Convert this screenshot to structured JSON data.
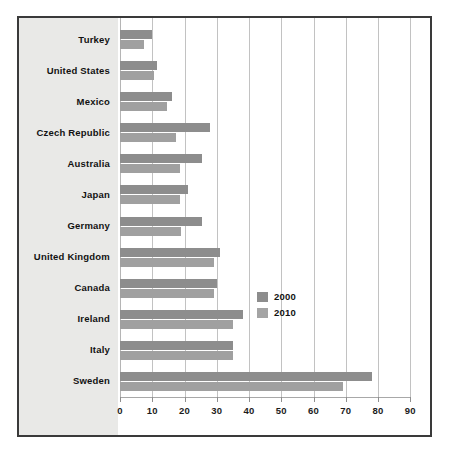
{
  "chart_data": {
    "type": "bar",
    "orientation": "horizontal",
    "title": "",
    "subtitle": "",
    "xlabel": "",
    "ylabel": "",
    "xlim": [
      0,
      90
    ],
    "xticks": [
      0,
      10,
      20,
      30,
      40,
      50,
      60,
      70,
      80,
      90
    ],
    "xtick_labels": [
      "0",
      "10",
      "20",
      "30",
      "40",
      "50",
      "60",
      "70",
      "80",
      "90"
    ],
    "grid": true,
    "grid_axis": "x",
    "legend_position": "middle-right",
    "categories": [
      "Turkey",
      "United States",
      "Mexico",
      "Czech Republic",
      "Australia",
      "Japan",
      "Germany",
      "United Kingdom",
      "Canada",
      "Ireland",
      "Italy",
      "Sweden"
    ],
    "series": [
      {
        "name": "2000",
        "color": "#8d8d8d",
        "values": [
          10,
          11.5,
          16,
          28,
          25.5,
          21,
          25.5,
          31,
          30,
          38,
          35,
          78
        ]
      },
      {
        "name": "2010",
        "color": "#a0a0a0",
        "values": [
          7.5,
          10.5,
          14.5,
          17.5,
          18.5,
          18.5,
          19,
          29,
          29,
          35,
          35,
          69
        ]
      }
    ]
  },
  "legend": {
    "items": [
      {
        "label": "2000",
        "color": "#8d8d8d"
      },
      {
        "label": "2010",
        "color": "#a4a4a4"
      }
    ]
  },
  "colors": {
    "frame_border": "#3a3a3a",
    "label_panel_bg": "#e9e9e7",
    "gridline": "#c2c2c2",
    "plot_bg": "#ffffff",
    "text": "#121212"
  }
}
